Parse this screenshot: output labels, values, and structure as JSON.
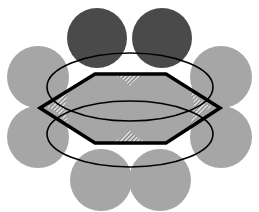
{
  "diagram": {
    "title": "",
    "width": 259,
    "height": 212,
    "colors": {
      "background": "#ffffff",
      "dark_circle": "#4a4a4a",
      "light_circle": "#a6a6a6",
      "outline": "#000000",
      "hatch_light": "#d8d8d8",
      "hatch_dark": "#5a5a5a"
    },
    "dark_circles": [
      {
        "id": "top-left-dark",
        "cx": 97,
        "cy": 38,
        "r": 30
      },
      {
        "id": "top-right-dark",
        "cx": 162,
        "cy": 38,
        "r": 30
      }
    ],
    "light_circles": [
      {
        "id": "upper-left",
        "cx": 38,
        "cy": 77,
        "r": 31
      },
      {
        "id": "upper-right",
        "cx": 221,
        "cy": 77,
        "r": 31
      },
      {
        "id": "lower-left",
        "cx": 38,
        "cy": 137,
        "r": 31
      },
      {
        "id": "lower-right",
        "cx": 221,
        "cy": 137,
        "r": 31
      },
      {
        "id": "bottom-left",
        "cx": 101,
        "cy": 180,
        "r": 31
      },
      {
        "id": "bottom-right",
        "cx": 160,
        "cy": 180,
        "r": 31
      },
      {
        "id": "center-left",
        "cx": 101,
        "cy": 108,
        "r": 36
      },
      {
        "id": "center-right",
        "cx": 158,
        "cy": 108,
        "r": 36
      }
    ],
    "hexagon": {
      "points": "40,108 95,74 166,74 220,108 166,143 95,143",
      "stroke_width": 3.5
    },
    "ellipses": [
      {
        "id": "upper-ellipse",
        "cx": 130,
        "cy": 87,
        "rx": 83,
        "ry": 34
      },
      {
        "id": "lower-ellipse",
        "cx": 130,
        "cy": 134,
        "rx": 83,
        "ry": 33
      }
    ]
  }
}
